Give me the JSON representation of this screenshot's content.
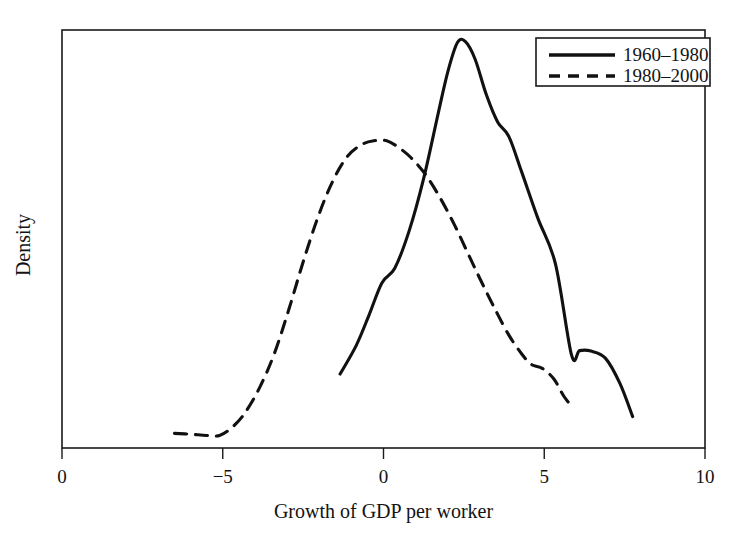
{
  "chart_data": {
    "type": "line",
    "title": "",
    "subtitle": "",
    "xlabel": "Growth of GDP per worker",
    "ylabel": "Density",
    "xlim": [
      -10,
      10
    ],
    "ylim": [
      0,
      1
    ],
    "grid": false,
    "legend_position": "top-right",
    "xticks": [
      -10,
      -5,
      0,
      5,
      10
    ],
    "xtick_labels": [
      "0",
      "−5",
      "0",
      "5",
      "10"
    ],
    "yticks": [],
    "ytick_labels": [],
    "annotations": [],
    "series": [
      {
        "name": "1960–1980",
        "style": "solid",
        "color": "#111111",
        "x": [
          -1.35,
          -0.85,
          -0.45,
          -0.05,
          0.35,
          0.8,
          1.25,
          1.7,
          2.0,
          2.3,
          2.55,
          2.85,
          3.2,
          3.55,
          3.9,
          4.3,
          4.8,
          5.35,
          5.85,
          6.1,
          6.45,
          6.9,
          7.35,
          7.75
        ],
        "y": [
          0.177,
          0.245,
          0.318,
          0.395,
          0.43,
          0.52,
          0.645,
          0.8,
          0.9,
          0.97,
          0.972,
          0.93,
          0.845,
          0.78,
          0.745,
          0.66,
          0.55,
          0.44,
          0.222,
          0.233,
          0.232,
          0.215,
          0.155,
          0.075
        ]
      },
      {
        "name": "1980–2000",
        "style": "dashed",
        "color": "#111111",
        "x": [
          -6.5,
          -6.0,
          -5.5,
          -5.1,
          -4.7,
          -4.3,
          -3.85,
          -3.4,
          -2.95,
          -2.5,
          -2.05,
          -1.6,
          -1.15,
          -0.7,
          -0.3,
          0.1,
          0.45,
          0.85,
          1.3,
          1.75,
          2.2,
          2.6,
          3.0,
          3.45,
          3.9,
          4.3,
          4.6,
          4.95,
          5.3,
          5.6,
          5.85
        ],
        "y": [
          0.035,
          0.033,
          0.03,
          0.03,
          0.05,
          0.085,
          0.145,
          0.225,
          0.33,
          0.445,
          0.55,
          0.635,
          0.695,
          0.725,
          0.735,
          0.735,
          0.72,
          0.695,
          0.655,
          0.6,
          0.535,
          0.47,
          0.405,
          0.335,
          0.27,
          0.225,
          0.2,
          0.19,
          0.165,
          0.125,
          0.1
        ]
      }
    ]
  },
  "legend": {
    "entries": [
      {
        "label": "1960–1980",
        "style": "solid"
      },
      {
        "label": "1980–2000",
        "style": "dashed"
      }
    ]
  },
  "axes": {
    "x_title": "Growth of GDP per worker",
    "y_title": "Density"
  }
}
